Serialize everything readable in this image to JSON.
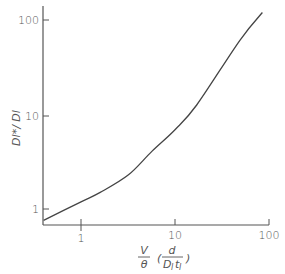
{
  "chart_data": {
    "type": "line",
    "title": "",
    "xlabel": "V/θ (d/(D_l t_l))",
    "ylabel": "D_l* / D_l",
    "xscale": "log",
    "yscale": "log",
    "xlim": [
      0.4,
      100
    ],
    "ylim": [
      0.6,
      150
    ],
    "x_ticks": [
      "1",
      "10",
      "100"
    ],
    "y_ticks": [
      "1",
      "10",
      "100"
    ],
    "grid": false,
    "legend": null,
    "series": [
      {
        "name": "D_l*/D_l",
        "x": [
          0.4,
          1,
          1.6,
          3.2,
          5.7,
          10,
          17,
          49,
          85
        ],
        "y": [
          0.76,
          1.19,
          1.5,
          2.3,
          4.1,
          6.9,
          12.6,
          61,
          120
        ]
      }
    ]
  },
  "labels": {
    "x_tick_1": "1",
    "x_tick_10": "10",
    "x_tick_100": "100",
    "y_tick_1": "1",
    "y_tick_10": "10",
    "y_tick_100": "100",
    "x_axis_V": "V",
    "x_axis_theta": "θ",
    "x_axis_d": "d",
    "x_axis_Dt": "D",
    "x_axis_l1": "l",
    "x_axis_t": "t",
    "x_axis_l2": "l",
    "x_axis_open": "(",
    "x_axis_close": ")",
    "y_axis": "Dl*/ Dl"
  },
  "colors": {
    "axis": "#555555",
    "curve": "#444444"
  }
}
